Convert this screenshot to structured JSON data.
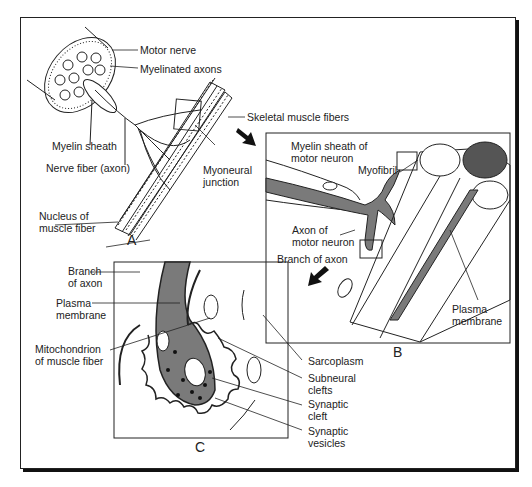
{
  "figure": {
    "panels": {
      "A": {
        "letter": "A",
        "labels": {
          "motor_nerve": "Motor nerve",
          "myelinated_axons": "Myelinated axons",
          "skeletal_muscle_fibers": "Skeletal muscle fibers",
          "myelin_sheath": "Myelin sheath",
          "nerve_fiber": "Nerve fiber (axon)",
          "myoneural_junction": "Myoneural\njunction",
          "nucleus_of_muscle_fiber": "Nucleus of\nmuscle fiber"
        }
      },
      "B": {
        "letter": "B",
        "labels": {
          "myelin_sheath_motor_neuron": "Myelin sheath of\nmotor neuron",
          "myofibril": "Myofibril",
          "axon_of_motor_neuron": "Axon of\nmotor neuron",
          "branch_of_axon": "Branch of axon",
          "plasma_membrane": "Plasma\nmembrane"
        }
      },
      "C": {
        "letter": "C",
        "labels": {
          "branch_of_axon": "Branch\nof axon",
          "plasma_membrane": "Plasma\nmembrane",
          "mitochondrion": "Mitochondrion\nof muscle fiber",
          "sarcoplasm": "Sarcoplasm",
          "subneural_clefts": "Subneural\nclefts",
          "synaptic_cleft": "Synaptic\ncleft",
          "synaptic_vesicles": "Synaptic\nvesicles"
        }
      }
    },
    "colors": {
      "ink": "#222222",
      "axon_fill": "#7a7a7a",
      "dark_fill": "#555555"
    }
  }
}
